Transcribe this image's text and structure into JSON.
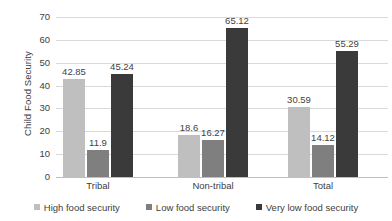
{
  "chart_data": {
    "type": "bar",
    "title": "",
    "xlabel": "",
    "ylabel": "Child Food Security",
    "categories": [
      "Tribal",
      "Non-tribal",
      "Total"
    ],
    "series": [
      {
        "name": "High food security",
        "color": "#bfbfbf",
        "values": [
          42.85,
          18.6,
          30.59
        ],
        "labels": [
          "42.85",
          "18.6",
          "30.59"
        ]
      },
      {
        "name": "Low food security",
        "color": "#7f7f7f",
        "values": [
          11.9,
          16.27,
          14.12
        ],
        "labels": [
          "11.9",
          "16.27",
          "14.12"
        ]
      },
      {
        "name": "Very low food security",
        "color": "#3a3a3a",
        "values": [
          45.24,
          65.12,
          55.29
        ],
        "labels": [
          "45.24",
          "65.12",
          "55.29"
        ]
      }
    ],
    "ylim": [
      0,
      70
    ],
    "ytick_step": 10,
    "ytick_labels": [
      "70",
      "60",
      "50",
      "40",
      "30",
      "20",
      "10",
      "0"
    ],
    "grid": true,
    "legend_position": "bottom",
    "data_labels": true
  }
}
